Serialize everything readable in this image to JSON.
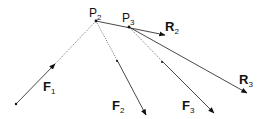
{
  "diagram": {
    "title": "",
    "points": [
      {
        "id": "P1",
        "x": 16,
        "y": 104,
        "label": ""
      },
      {
        "id": "P2",
        "x": 96,
        "y": 21,
        "label": "P",
        "sub": "2"
      },
      {
        "id": "P3",
        "x": 129,
        "y": 27,
        "label": "P",
        "sub": "3"
      }
    ],
    "vectors": [
      {
        "id": "F1",
        "label": "F",
        "sub": "1",
        "from": [
          16,
          104
        ],
        "to": [
          96,
          21
        ],
        "style": "solid-to-dotted",
        "arrow_at": [
          53,
          66
        ],
        "label_pos": [
          40,
          91
        ]
      },
      {
        "id": "F2",
        "label": "F",
        "sub": "2",
        "from": [
          96,
          21
        ],
        "to": [
          146,
          115
        ],
        "style": "dotted-to-solid",
        "label_pos": [
          118,
          111
        ]
      },
      {
        "id": "F3",
        "label": "F",
        "sub": "3",
        "from": [
          129,
          27
        ],
        "to": [
          214,
          113
        ],
        "style": "dotted-to-solid",
        "label_pos": [
          185,
          109
        ]
      },
      {
        "id": "R2",
        "label": "R",
        "sub": "2",
        "from": [
          96,
          21
        ],
        "to": [
          165,
          35
        ],
        "style": "solid",
        "label_pos": [
          165,
          30
        ]
      },
      {
        "id": "R3",
        "label": "R",
        "sub": "3",
        "from": [
          129,
          27
        ],
        "to": [
          247,
          93
        ],
        "style": "solid",
        "label_pos": [
          239,
          83
        ]
      }
    ],
    "colors": {
      "line": "#333333",
      "text": "#111111",
      "background": "#ffffff"
    }
  }
}
